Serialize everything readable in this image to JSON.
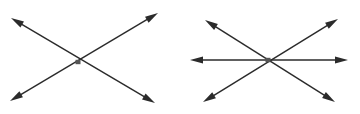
{
  "document": {
    "title": "Intersecting lines figure",
    "background_color": "#ffffff",
    "line_color": "#2b2b2b",
    "node_color": "#555555",
    "width": 360,
    "height": 114
  },
  "chart_data": {
    "type": "diagram",
    "xlabel": "",
    "ylabel": "",
    "figures": [
      {
        "name": "figure-left",
        "label": "Two lines intersecting at one point",
        "line_count": 2,
        "arrowhead_count": 4,
        "intersection_points": 1,
        "intersection": {
          "x": 78,
          "y": 62
        },
        "lines": [
          {
            "name": "line-left-down-right",
            "from": {
              "x": 11,
              "y": 18
            },
            "to": {
              "x": 155,
              "y": 103
            },
            "arrow_start": true,
            "arrow_end": true
          },
          {
            "name": "line-left-up-right",
            "from": {
              "x": 10,
              "y": 101
            },
            "to": {
              "x": 158,
              "y": 13
            },
            "arrow_start": true,
            "arrow_end": true
          }
        ]
      },
      {
        "name": "figure-right",
        "label": "Three concurrent lines intersecting at one point",
        "line_count": 3,
        "arrowhead_count": 6,
        "intersection_points": 1,
        "intersection": {
          "x": 268,
          "y": 60
        },
        "lines": [
          {
            "name": "line-right-horizontal",
            "from": {
              "x": 190,
              "y": 60
            },
            "to": {
              "x": 348,
              "y": 60
            },
            "arrow_start": true,
            "arrow_end": true
          },
          {
            "name": "line-right-down-right",
            "from": {
              "x": 205,
              "y": 20
            },
            "to": {
              "x": 335,
              "y": 102
            },
            "arrow_start": true,
            "arrow_end": true
          },
          {
            "name": "line-right-up-right",
            "from": {
              "x": 203,
              "y": 102
            },
            "to": {
              "x": 338,
              "y": 19
            },
            "arrow_start": true,
            "arrow_end": true
          }
        ]
      }
    ],
    "annotations": [],
    "legend": []
  }
}
